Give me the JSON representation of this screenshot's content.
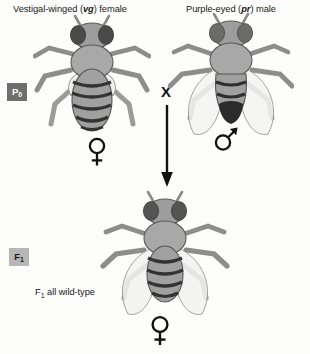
{
  "figure": {
    "title_left": "Vestigal-winged (vg) female",
    "title_right": "Purple-eyed (pr) male",
    "cross_symbol": "X"
  },
  "parents": {
    "female": {
      "phenotype_text_before": "Vestigal-winged (",
      "allele": "vg",
      "phenotype_text_after": ") female",
      "sex_symbol": "female-symbol",
      "generation_label": "P",
      "generation_sub": "0",
      "wings": "vestigial",
      "eye_color": "#4a4a4a",
      "body_color": "#9a9a9a"
    },
    "male": {
      "phenotype_text_before": "Purple-eyed (",
      "allele": "pr",
      "phenotype_text_after": ") male",
      "sex_symbol": "male-symbol",
      "generation_label": "P",
      "generation_sub": "0",
      "wings": "full",
      "eye_color": "#6b6b6b",
      "body_color": "#9a9a9a"
    }
  },
  "offspring": {
    "generation_label": "F",
    "generation_sub": "1",
    "note_prefix": "F",
    "note_sub": "1",
    "note_suffix": " all wild-type",
    "sex_symbol": "female-symbol",
    "wings": "full",
    "eye_color": "#545454",
    "body_color": "#9a9a9a"
  },
  "colors": {
    "background": "#fdfdfb",
    "ink": "#1a1a1a",
    "p0_tag_bg": "#6f6f6f",
    "p0_tag_text": "#ffffff",
    "f1_tag_bg": "#b6b6b6",
    "f1_tag_text": "#1b1b1b",
    "body_gray": "#9a9a9a",
    "thorax_gray": "#a5a5a5",
    "eye_dark": "#4a4a4a",
    "stripe_dark": "#3a3a3a",
    "wing_fill": "#e8e8e6",
    "leg_gray": "#bdbdbd"
  }
}
